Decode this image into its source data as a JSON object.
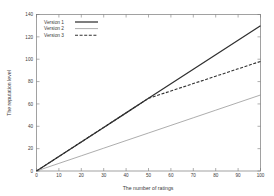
{
  "chart_data": {
    "type": "line",
    "title": "",
    "subtitle": "",
    "xlabel": "The number of ratings",
    "ylabel": "The reputation level",
    "xlim": [
      0,
      100
    ],
    "ylim": [
      0,
      140
    ],
    "xticks": [
      0,
      10,
      20,
      30,
      40,
      50,
      60,
      70,
      80,
      90,
      100
    ],
    "xtick_labels": [
      "0",
      "10",
      "20",
      "30",
      "40",
      "50",
      "60",
      "70",
      "80",
      "90",
      "100"
    ],
    "yticks": [
      0,
      20,
      40,
      60,
      80,
      100,
      120,
      140
    ],
    "ytick_labels": [
      "0",
      "20",
      "40",
      "60",
      "80",
      "100",
      "120",
      "140"
    ],
    "grid": false,
    "legend_position": "upper left inside",
    "series": [
      {
        "name": "Version 1",
        "style": "solid-thick",
        "color": "#303030",
        "x": [
          0,
          10,
          20,
          30,
          40,
          50,
          60,
          70,
          80,
          90,
          100
        ],
        "values": [
          0,
          13,
          26,
          39,
          52,
          65,
          78,
          91,
          104,
          117,
          130
        ]
      },
      {
        "name": "Version 2",
        "style": "solid-thin",
        "color": "#8a8a8a",
        "x": [
          0,
          10,
          20,
          30,
          40,
          50,
          60,
          70,
          80,
          90,
          100
        ],
        "values": [
          0,
          6.8,
          13.6,
          20.4,
          27.2,
          34,
          40.8,
          47.6,
          54.4,
          61.2,
          68
        ]
      },
      {
        "name": "Version 3",
        "style": "dashed",
        "color": "#303030",
        "x": [
          0,
          10,
          20,
          30,
          40,
          50,
          60,
          70,
          80,
          90,
          100
        ],
        "values": [
          0,
          13,
          26,
          39,
          52,
          65,
          71.6,
          78.2,
          84.8,
          91.4,
          98
        ]
      }
    ],
    "legend_entries": [
      {
        "label": "Version 1",
        "style": "solid-thick",
        "color": "#303030"
      },
      {
        "label": "Version 2",
        "style": "solid-thin",
        "color": "#8a8a8a"
      },
      {
        "label": "Version 3",
        "style": "dashed",
        "color": "#303030"
      }
    ]
  },
  "colors": {
    "background": "#ffffff",
    "axis": "#7a7a7a",
    "text": "#3a3a3a",
    "series1": "#303030",
    "series2": "#8a8a8a",
    "series3": "#303030"
  }
}
